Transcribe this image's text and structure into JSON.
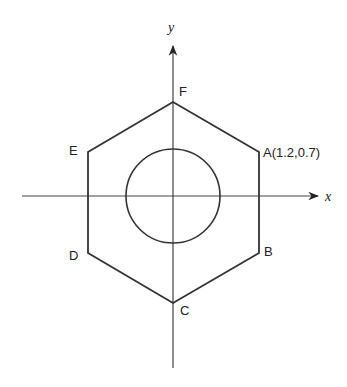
{
  "diagram": {
    "axes": {
      "x_label": "x",
      "y_label": "y"
    },
    "vertices": [
      {
        "id": "A",
        "label": "A(1.2,0.7)"
      },
      {
        "id": "B",
        "label": "B"
      },
      {
        "id": "C",
        "label": "C"
      },
      {
        "id": "D",
        "label": "D"
      },
      {
        "id": "E",
        "label": "E"
      },
      {
        "id": "F",
        "label": "F"
      }
    ],
    "shapes": [
      "regular hexagon",
      "inscribed circle centered at origin"
    ],
    "colors": {
      "stroke": "#333333",
      "axis": "#444444",
      "background": "#ffffff"
    }
  }
}
